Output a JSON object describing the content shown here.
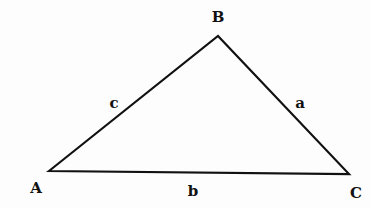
{
  "diagram": {
    "type": "triangle",
    "stroke_color": "#111111",
    "background": "#fdfdfd",
    "vertices": [
      {
        "name": "A",
        "x": 49,
        "y": 171,
        "label_x": 36,
        "label_y": 193
      },
      {
        "name": "B",
        "x": 218,
        "y": 36,
        "label_x": 218,
        "label_y": 22
      },
      {
        "name": "C",
        "x": 349,
        "y": 174,
        "label_x": 356,
        "label_y": 198
      }
    ],
    "sides": [
      {
        "name": "c",
        "between": "A-B",
        "label_x": 114,
        "label_y": 108
      },
      {
        "name": "a",
        "between": "B-C",
        "label_x": 300,
        "label_y": 108
      },
      {
        "name": "b",
        "between": "A-C",
        "label_x": 193,
        "label_y": 196
      }
    ]
  }
}
